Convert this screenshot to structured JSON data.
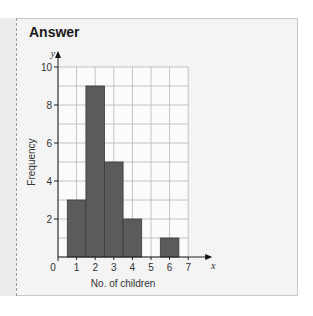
{
  "panel": {
    "title": "Answer"
  },
  "chart_data": {
    "type": "bar",
    "subtype": "histogram",
    "title": "",
    "xlabel": "No. of children",
    "ylabel": "Frequency",
    "x_axis_letter": "x",
    "y_axis_letter": "y",
    "categories": [
      1,
      2,
      3,
      4,
      5,
      6
    ],
    "values": [
      3,
      9,
      5,
      2,
      0,
      1
    ],
    "xlim": [
      0,
      7
    ],
    "ylim": [
      0,
      10
    ],
    "x_ticks": [
      "0",
      "1",
      "2",
      "3",
      "4",
      "5",
      "6",
      "7"
    ],
    "y_ticks": [
      "2",
      "4",
      "6",
      "8",
      "10"
    ],
    "grid": true,
    "bar_color": "#5b5b5b",
    "legend": null
  }
}
